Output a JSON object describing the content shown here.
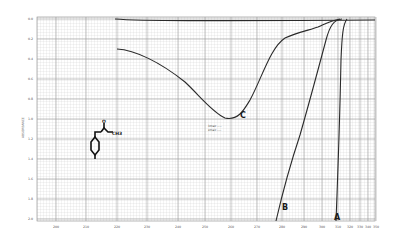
{
  "chart_data": {
    "type": "line",
    "title": "",
    "xlabel": "Wavelength (nm)",
    "ylabel": "ABSORBANCE",
    "y_inverted": true,
    "ylim": [
      0.0,
      2.0
    ],
    "xlim": [
      195,
      355
    ],
    "grid": true,
    "y_ticks": [
      "0.0",
      "0.2",
      "0.4",
      "0.6",
      "0.8",
      "1.0",
      "1.2",
      "1.4",
      "1.6",
      "1.8",
      "2.0"
    ],
    "x_ticks": [
      "200",
      "210",
      "220",
      "230",
      "240",
      "250",
      "260",
      "270",
      "280",
      "290",
      "300",
      "310",
      "320",
      "330",
      "340",
      "350"
    ],
    "series": [
      {
        "name": "baseline",
        "label": "",
        "x": [
          215,
          240,
          270,
          300,
          330,
          355
        ],
        "y": [
          0.0,
          0.02,
          0.02,
          0.02,
          0.02,
          0.02
        ]
      },
      {
        "name": "C",
        "label": "C",
        "x": [
          215,
          225,
          235,
          245,
          252,
          258,
          265,
          272,
          280,
          290,
          300,
          310,
          316
        ],
        "y": [
          0.29,
          0.36,
          0.48,
          0.7,
          0.88,
          0.99,
          0.92,
          0.7,
          0.4,
          0.22,
          0.14,
          0.06,
          0.0
        ]
      },
      {
        "name": "B",
        "label": "B",
        "x": [
          283,
          290,
          298,
          305,
          310,
          314,
          318
        ],
        "y": [
          2.0,
          1.5,
          1.0,
          0.5,
          0.2,
          0.05,
          0.0
        ]
      },
      {
        "name": "A",
        "label": "A",
        "x": [
          314,
          316,
          318,
          320,
          322
        ],
        "y": [
          2.0,
          1.2,
          0.5,
          0.1,
          0.0
        ]
      }
    ],
    "annotations": [
      {
        "text": "C",
        "near": "curve C minimum",
        "x": 258,
        "y": 0.99
      },
      {
        "text": "λmax ... εmax ...",
        "near": "below curve C minimum"
      },
      {
        "text": "B",
        "near": "bottom of curve B"
      },
      {
        "text": "A",
        "near": "bottom of curve A"
      },
      {
        "text": "chemical structure (para-substituted benzene with NH–C(=O)–CH3 group)",
        "near": "left middle"
      }
    ]
  },
  "labels": {
    "y_axis_title": "ABSORBANCE",
    "curve_c": "C",
    "curve_b": "B",
    "curve_a": "A",
    "annot_line1": "λmax   ----",
    "annot_line2": "εmax   ----",
    "struct_o": "O",
    "struct_ch3": "CH3",
    "struct_nh": "NH",
    "struct_bottom": "X"
  },
  "colors": {
    "grid_major": "#9a9a9a",
    "grid_minor": "#c9c9c9",
    "curve": "#2a2a2a",
    "background": "#ffffff"
  }
}
